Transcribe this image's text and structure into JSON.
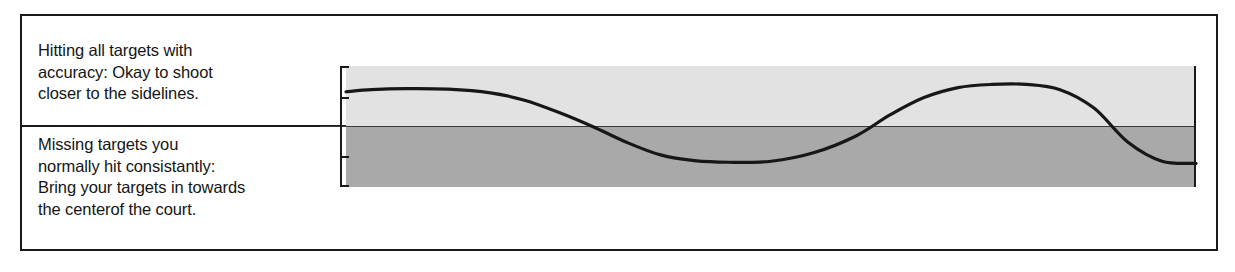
{
  "figure": {
    "captions": {
      "upper": "Hitting all targets with\naccuracy:  Okay to shoot\ncloser to the sidelines.",
      "lower": "Missing targets you\nnormally hit consistantly:\nBring your targets in towards\nthe centerof the court."
    },
    "colors": {
      "ink": "#1a1a1a",
      "band_upper": "#e2e2e2",
      "band_lower": "#a9a9a9",
      "separator": "#3a3a3a",
      "page": "#ffffff"
    }
  },
  "chart_data": {
    "type": "line",
    "title": "",
    "xlabel": "",
    "ylabel": "",
    "xlim": [
      0,
      100
    ],
    "ylim": [
      -1.15,
      1.15
    ],
    "grid": false,
    "legend": null,
    "annotations": [
      "upper band = hitting all targets with accuracy",
      "lower band = missing targets you normally hit consistantly"
    ],
    "bands": [
      {
        "name": "accuracy-zone",
        "y_from": 0.0,
        "y_to": 1.15,
        "color": "#e2e2e2"
      },
      {
        "name": "missing-zone",
        "y_from": -1.15,
        "y_to": 0.0,
        "color": "#a9a9a9"
      }
    ],
    "threshold_line": {
      "y": 0.0,
      "color": "#3a3a3a"
    },
    "axis_ticks_y": [
      1.15,
      0.56,
      -0.56,
      -1.15
    ],
    "series": [
      {
        "name": "performance",
        "x": [
          0,
          3,
          7,
          12,
          17,
          21,
          25,
          29,
          33,
          37,
          41,
          45,
          50,
          55,
          60,
          64,
          68,
          72,
          76,
          80,
          84,
          88,
          92,
          96,
          100
        ],
        "values": [
          0.66,
          0.7,
          0.72,
          0.71,
          0.64,
          0.5,
          0.27,
          0.0,
          -0.3,
          -0.54,
          -0.65,
          -0.68,
          -0.66,
          -0.5,
          -0.18,
          0.22,
          0.55,
          0.74,
          0.8,
          0.8,
          0.7,
          0.35,
          -0.3,
          -0.66,
          -0.7
        ]
      }
    ]
  }
}
